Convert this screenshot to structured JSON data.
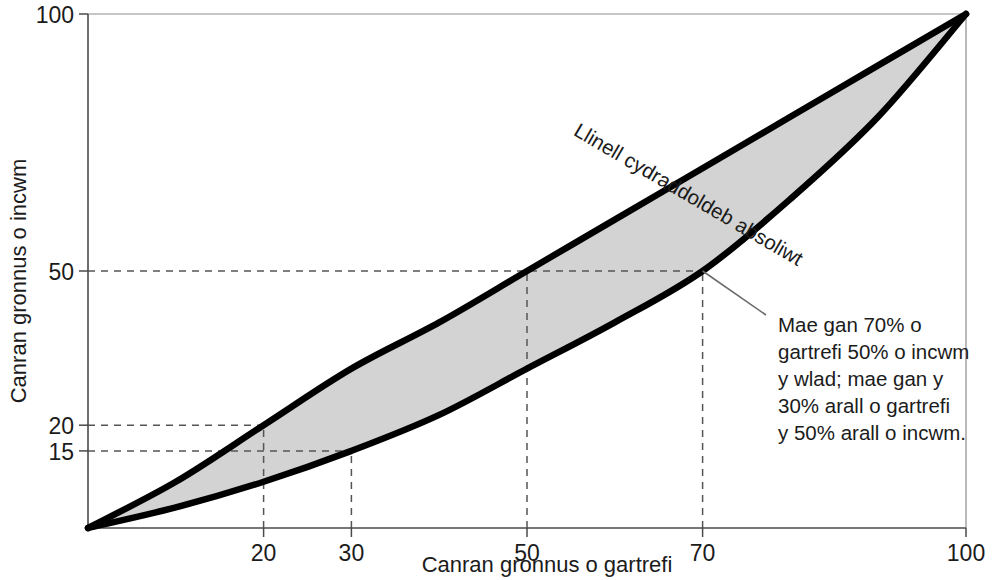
{
  "figure": {
    "background_color": "#ffffff",
    "band_fill_color": "#d3d3d3",
    "curve_color": "#000000",
    "axis_color": "#4a4a4a",
    "guide_color": "#555555"
  },
  "axes": {
    "x_title": "Canran gronnus o gartrefi",
    "y_title": "Canran gronnus o incwm",
    "x_ticks": [
      "20",
      "30",
      "50",
      "70",
      "100"
    ],
    "y_ticks": [
      "100",
      "50",
      "20",
      "15"
    ]
  },
  "labels": {
    "equality_line": "Llinell cydraddoldeb absoliwt",
    "annotation": [
      "Mae gan 70% o",
      "gartrefi 50% o incwm",
      "y wlad; mae gan y",
      "30% arall o gartrefi",
      "y 50% arall o incwm."
    ]
  },
  "chart_data": {
    "type": "area",
    "title": "",
    "subtitle": "",
    "xlabel": "Canran gronnus o gartrefi",
    "ylabel": "Canran gronnus o incwm",
    "xlim": [
      0,
      100
    ],
    "ylim": [
      0,
      100
    ],
    "xticks": [
      20,
      30,
      50,
      70,
      100
    ],
    "yticks": [
      15,
      20,
      50,
      100
    ],
    "grid": false,
    "legend": "none",
    "annotations": [
      {
        "text": "Llinell cydraddoldeb absoliwt",
        "placement": "along-upper-curve",
        "rotation_deg": -24
      },
      {
        "text": "Mae gan 70% o gartrefi 50% o incwm y wlad; mae gan y 30% arall o gartrefi y 50% arall o incwm.",
        "points_to": {
          "x": 70,
          "y": 50
        },
        "placement": "right-of-plot"
      }
    ],
    "series": [
      {
        "name": "Llinell cydraddoldeb absoliwt (uchaf)",
        "role": "upper-bound",
        "x": [
          0,
          10,
          20,
          30,
          40,
          50,
          60,
          70,
          80,
          90,
          100
        ],
        "y": [
          0,
          9,
          20,
          31,
          40,
          50,
          60,
          70,
          80,
          90,
          100
        ]
      },
      {
        "name": "Cromlin Lorenz (isaf)",
        "role": "lower-bound",
        "x": [
          0,
          10,
          20,
          30,
          40,
          50,
          60,
          70,
          80,
          90,
          100
        ],
        "y": [
          0,
          4,
          9,
          15,
          22,
          31,
          40,
          50,
          64,
          80,
          100
        ]
      }
    ],
    "shaded_region": {
      "label": "Ardal rhwng y ddwy gromlin",
      "between": [
        "upper-bound",
        "lower-bound"
      ],
      "fill": "#d3d3d3"
    },
    "reference_lines": [
      {
        "orientation": "horizontal",
        "value": 50,
        "from_x": 0,
        "to_x": 70,
        "style": "dashed"
      },
      {
        "orientation": "horizontal",
        "value": 20,
        "from_x": 0,
        "to_x": 20,
        "style": "dashed"
      },
      {
        "orientation": "horizontal",
        "value": 15,
        "from_x": 0,
        "to_x": 30,
        "style": "dashed"
      },
      {
        "orientation": "vertical",
        "value": 20,
        "from_y": 0,
        "to_y": 20,
        "style": "dashed"
      },
      {
        "orientation": "vertical",
        "value": 30,
        "from_y": 0,
        "to_y": 15,
        "style": "dashed"
      },
      {
        "orientation": "vertical",
        "value": 50,
        "from_y": 0,
        "to_y": 50,
        "style": "dashed"
      },
      {
        "orientation": "vertical",
        "value": 70,
        "from_y": 0,
        "to_y": 50,
        "style": "dashed"
      }
    ],
    "key_points": [
      {
        "x": 20,
        "y": 20,
        "on": "upper-bound"
      },
      {
        "x": 50,
        "y": 50,
        "on": "upper-bound"
      },
      {
        "x": 30,
        "y": 15,
        "on": "lower-bound"
      },
      {
        "x": 70,
        "y": 50,
        "on": "lower-bound"
      }
    ]
  }
}
